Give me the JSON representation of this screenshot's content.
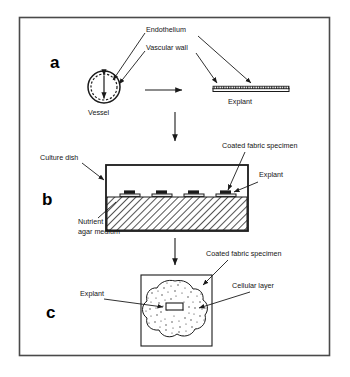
{
  "figure": {
    "background": "#ffffff",
    "ink_color": "#151515",
    "frame_color": "#4a4a4a",
    "panels": [
      {
        "letter": "a",
        "caption_labels": [
          "Endothelium",
          "Vascular wall",
          "Vessel",
          "Explant"
        ]
      },
      {
        "letter": "b",
        "caption_labels": [
          "Culture dish",
          "Coated fabric specimen",
          "Explant",
          "Nutrient agar medium"
        ]
      },
      {
        "letter": "c",
        "caption_labels": [
          "Coated fabric specimen",
          "Cellular layer",
          "Explant"
        ]
      }
    ]
  },
  "panel_a": {
    "letter": "a",
    "label_endothelium": "Endothelium",
    "label_vascular_wall": "Vascular wall",
    "label_vessel": "Vessel",
    "label_explant": "Explant"
  },
  "panel_b": {
    "letter": "b",
    "label_culture_dish": "Culture dish",
    "label_coated_fabric_specimen": "Coated fabric specimen",
    "label_explant": "Explant",
    "label_nutrient_line1": "Nutrient",
    "label_nutrient_line2": "agar medium",
    "specimen_count": 4
  },
  "panel_c": {
    "letter": "c",
    "label_coated_fabric_specimen": "Coated fabric specimen",
    "label_cellular_layer": "Cellular layer",
    "label_explant": "Explant"
  }
}
